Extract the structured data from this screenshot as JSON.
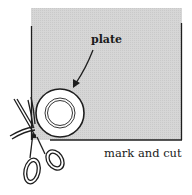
{
  "diagram": {
    "labels": {
      "plate": "plate",
      "caption": "mark and cut"
    },
    "colors": {
      "fabric_fill": "#d4d4d4",
      "outline": "#1e1e1e",
      "plate_fill": "#ffffff",
      "background": "#ffffff"
    },
    "elements": [
      "fabric-sheet",
      "plate",
      "arrow",
      "scissors"
    ]
  }
}
